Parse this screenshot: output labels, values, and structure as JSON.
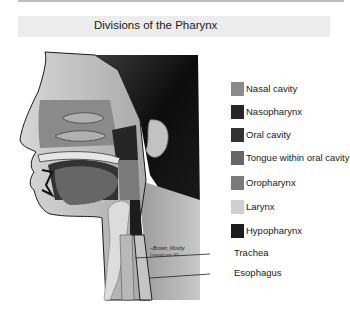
{
  "title": "Divisions of the Pharynx",
  "legend": {
    "items": [
      {
        "label": "Nasal cavity",
        "color": "#8a8a8a",
        "top": 0
      },
      {
        "label": "Nasopharynx",
        "color": "#262626",
        "top": 23
      },
      {
        "label": "Oral cavity",
        "color": "#333333",
        "top": 46
      },
      {
        "label": "Tongue within oral cavity",
        "color": "#666666",
        "top": 69
      },
      {
        "label": "Oropharynx",
        "color": "#7a7a7a",
        "top": 94
      },
      {
        "label": "Larynx",
        "color": "#cfcfcf",
        "top": 118
      },
      {
        "label": "Hypopharynx",
        "color": "#1c1c1c",
        "top": 142
      }
    ]
  },
  "callouts": [
    {
      "label": "Trachea",
      "top": 247
    },
    {
      "label": "Esophagus",
      "top": 267
    }
  ],
  "figure": {
    "signature": "illustrator signature"
  }
}
